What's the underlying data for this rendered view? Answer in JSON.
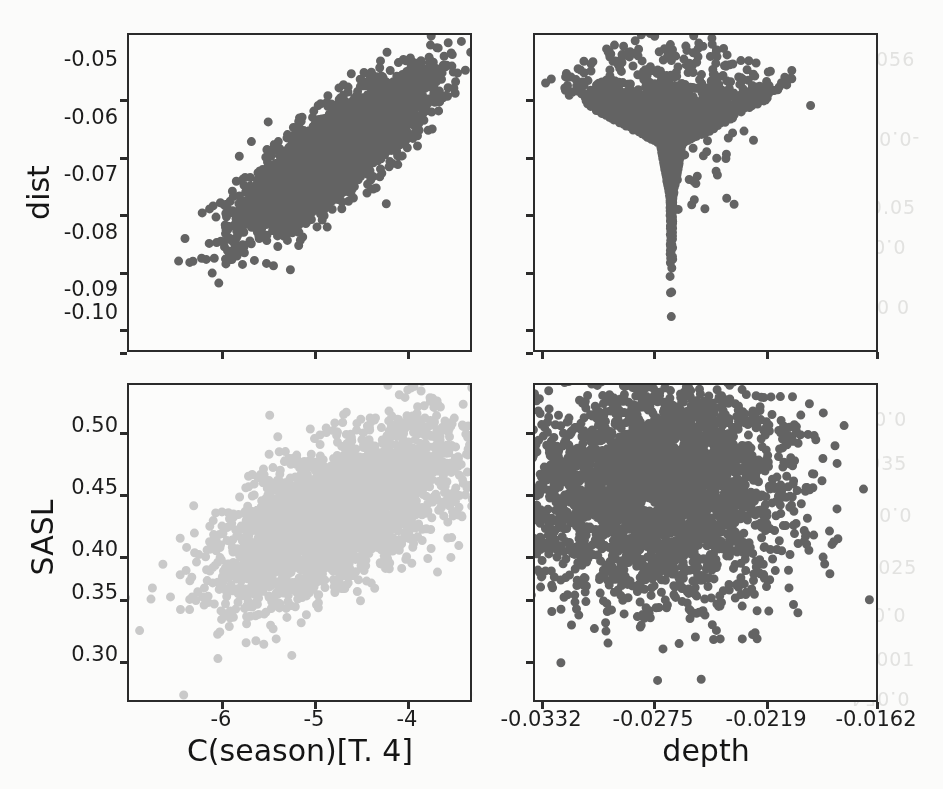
{
  "figure": {
    "kind": "scatter-plot-matrix",
    "rows": 2,
    "columns": 2,
    "background_color": "#fbfbfa",
    "frame_color": "#2b2b2b"
  },
  "colors": {
    "marker_dark": "#4d4d4d",
    "marker_light": "#c2c2c2",
    "axis": "#2b2b2b",
    "text": "#1d1d1d"
  },
  "axes": {
    "y_dist": {
      "label": "dist",
      "ticks": [
        "-0.05",
        "-0.06",
        "-0.07",
        "-0.08",
        "-0.09",
        "-0.10"
      ],
      "values": [
        -0.05,
        -0.06,
        -0.07,
        -0.08,
        -0.09,
        -0.1
      ],
      "range": [
        -0.106,
        -0.0435
      ]
    },
    "y_sasl": {
      "label": "SASL",
      "ticks": [
        "0.50",
        "0.45",
        "0.40",
        "0.35",
        "0.30"
      ],
      "values": [
        0.5,
        0.45,
        0.4,
        0.35,
        0.3
      ],
      "range": [
        0.272,
        0.524
      ]
    },
    "x_season": {
      "label": "C(season)[T. 4]",
      "ticks": [
        "-6",
        "-5",
        "-4"
      ],
      "values": [
        -6,
        -5,
        -4
      ],
      "range": [
        -7.15,
        -3.2
      ]
    },
    "x_depth": {
      "label": "depth",
      "ticks": [
        "-0.0332",
        "-0.0275",
        "-0.0219",
        "-0.0162"
      ],
      "values": [
        -0.0332,
        -0.0275,
        -0.0219,
        -0.0162
      ],
      "range": [
        -0.0349,
        -0.01475
      ]
    }
  },
  "bleed_through": [
    {
      "text": "-0.056",
      "x": 848,
      "y": 48
    },
    {
      "text": "-0.080",
      "x": 852,
      "y": 128
    },
    {
      "text": "-0.05",
      "x": 862,
      "y": 196
    },
    {
      "text": "0.045",
      "x": 846,
      "y": 236
    },
    {
      "text": "-20 0",
      "x": 856,
      "y": 296
    },
    {
      "text": "0.05",
      "x": 860,
      "y": 408
    },
    {
      "text": "0.035",
      "x": 848,
      "y": 452
    },
    {
      "text": "0.004",
      "x": 852,
      "y": 504
    },
    {
      "text": "0.025",
      "x": 858,
      "y": 556
    },
    {
      "text": "0.045",
      "x": 846,
      "y": 604
    },
    {
      "text": "0.001",
      "x": 856,
      "y": 648
    },
    {
      "text": "0.054",
      "x": 850,
      "y": 688
    }
  ],
  "chart_data": {
    "type": "scatter",
    "title": "",
    "layout": "2x2 pair plot (scatter plot matrix)",
    "legend": "none",
    "grid": false,
    "panels": [
      {
        "id": "dist-vs-season",
        "row": 0,
        "col": 0,
        "xlabel": "C(season)[T. 4]",
        "ylabel": "dist",
        "xlim": [
          -7.15,
          -3.2
        ],
        "ylim": [
          -0.106,
          -0.0435
        ],
        "xticks": [
          -6,
          -5,
          -4
        ],
        "yticks": [
          -0.05,
          -0.06,
          -0.07,
          -0.08,
          -0.09,
          -0.1
        ],
        "marker_color": "#4d4d4d",
        "marker_size": 9,
        "n_points": 3000,
        "shape": "elongated diagonal band, strong positive correlation",
        "correlation": 0.94,
        "cloud": {
          "cx": 0.6,
          "cy": 0.38,
          "sx": 0.175,
          "sy": 0.175,
          "rot_deg": -42,
          "aspect": 0.3
        },
        "tail": "sparse lower-left scatter trailing toward (-7.1, -0.105)"
      },
      {
        "id": "dist-vs-depth",
        "row": 0,
        "col": 1,
        "xlabel": "depth",
        "ylabel": "dist",
        "xlim": [
          -0.0349,
          -0.01475
        ],
        "ylim": [
          -0.106,
          -0.0435
        ],
        "xticks": [
          -0.0332,
          -0.0275,
          -0.0219,
          -0.0162
        ],
        "yticks": [
          -0.05,
          -0.06,
          -0.07,
          -0.08,
          -0.09,
          -0.1
        ],
        "marker_color": "#4d4d4d",
        "marker_size": 9,
        "n_points": 3000,
        "shape": "inverted triangle / heart: broad at top, tapering to apex at bottom-centre",
        "correlation": -0.2,
        "cloud": {
          "cx": 0.4,
          "cy": 0.35,
          "sx": 0.21,
          "sy": 0.2,
          "rot_deg": 0,
          "aspect": 1.0
        },
        "tail": "outlier spray extending to the right edge"
      },
      {
        "id": "sasl-vs-season",
        "row": 1,
        "col": 0,
        "xlabel": "C(season)[T. 4]",
        "ylabel": "SASL",
        "xlim": [
          -7.15,
          -3.2
        ],
        "ylim": [
          0.272,
          0.524
        ],
        "xticks": [
          -6,
          -5,
          -4
        ],
        "yticks": [
          0.5,
          0.45,
          0.4,
          0.35,
          0.3
        ],
        "marker_color": "#c2c2c2",
        "marker_size": 9,
        "n_points": 3000,
        "shape": "diagonal ellipse, moderate positive correlation",
        "correlation": 0.68,
        "cloud": {
          "cx": 0.62,
          "cy": 0.4,
          "sx": 0.2,
          "sy": 0.2,
          "rot_deg": -33,
          "aspect": 0.47
        },
        "tail": "scattered low points along the bottom-left"
      },
      {
        "id": "sasl-vs-depth",
        "row": 1,
        "col": 1,
        "xlabel": "depth",
        "ylabel": "SASL",
        "xlim": [
          -0.0349,
          -0.01475
        ],
        "ylim": [
          0.272,
          0.524
        ],
        "xticks": [
          -0.0332,
          -0.0275,
          -0.0219,
          -0.0162
        ],
        "yticks": [
          0.5,
          0.45,
          0.4,
          0.35,
          0.3
        ],
        "marker_color": "#4d4d4d",
        "marker_size": 9,
        "n_points": 3000,
        "shape": "round blob concentrated upper-left with a rightward tail of outliers",
        "correlation": -0.25,
        "cloud": {
          "cx": 0.38,
          "cy": 0.33,
          "sx": 0.195,
          "sy": 0.185,
          "rot_deg": -12,
          "aspect": 0.9
        },
        "tail": "sparse points toward lower-right"
      }
    ]
  }
}
